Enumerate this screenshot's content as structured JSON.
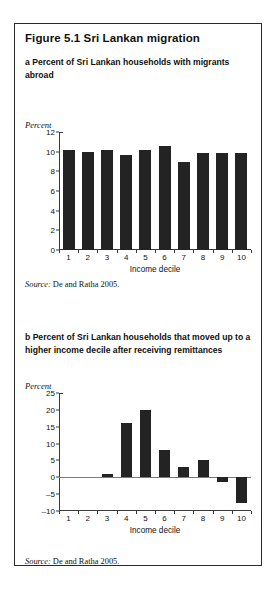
{
  "figure": {
    "title": "Figure 5.1  Sri Lankan migration",
    "border_color": "#2a2a2a",
    "bar_color": "#232323"
  },
  "panel_a": {
    "label": "a  Percent of Sri Lankan households with migrants abroad",
    "unit_label": "Percent",
    "source": "Source: De and Ratha 2005.",
    "source_prefix": "Source:",
    "source_text": " De and Ratha 2005."
  },
  "panel_b": {
    "label": "b  Percent of Sri Lankan households that moved up to a higher income decile after receiving remittances",
    "unit_label": "Percent",
    "source": "Source: De and Ratha 2005.",
    "source_prefix": "Source:",
    "source_text": " De and Ratha 2005."
  },
  "chart_data": [
    {
      "type": "bar",
      "id": "panel-a",
      "title": "a  Percent of Sri Lankan households with migrants abroad",
      "categories": [
        "1",
        "2",
        "3",
        "4",
        "5",
        "6",
        "7",
        "8",
        "9",
        "10"
      ],
      "values": [
        10.2,
        10.0,
        10.2,
        9.7,
        10.2,
        10.6,
        9.0,
        9.9,
        9.9,
        9.9
      ],
      "xlabel": "Income decile",
      "ylabel": "Percent",
      "ylim": [
        0,
        12
      ],
      "yticks": [
        0,
        2,
        4,
        6,
        8,
        10,
        12
      ],
      "ytick_labels": [
        "0",
        "2",
        "4",
        "6",
        "8",
        "10",
        "12"
      ],
      "grid": false,
      "legend": false,
      "bar_color": "#232323"
    },
    {
      "type": "bar",
      "id": "panel-b",
      "title": "b  Percent of Sri Lankan households that moved up to a higher income decile after receiving remittances",
      "categories": [
        "1",
        "2",
        "3",
        "4",
        "5",
        "6",
        "7",
        "8",
        "9",
        "10"
      ],
      "values": [
        0,
        0,
        1.0,
        16.0,
        20.0,
        8.0,
        3.0,
        5.0,
        -1.5,
        -7.5
      ],
      "xlabel": "Income decile",
      "ylabel": "Percent",
      "ylim": [
        -10,
        25
      ],
      "yticks": [
        -10,
        -5,
        0,
        5,
        10,
        15,
        20,
        25
      ],
      "ytick_labels": [
        "–10",
        "–5",
        "0",
        "5",
        "10",
        "15",
        "20",
        "25"
      ],
      "grid": false,
      "legend": false,
      "bar_color": "#232323"
    }
  ]
}
